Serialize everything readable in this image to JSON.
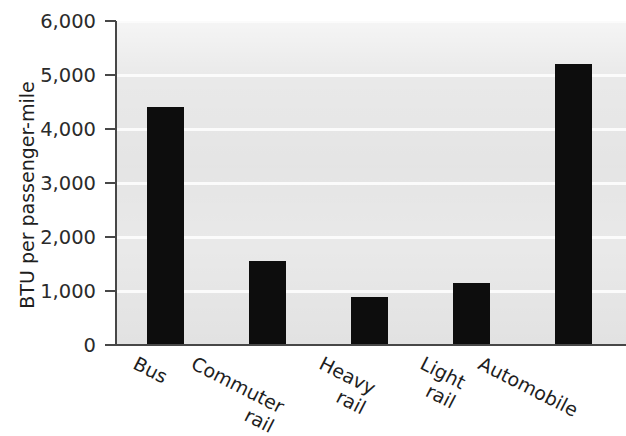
{
  "chart_data": {
    "type": "bar",
    "title": "",
    "subtitle": "",
    "xlabel": "",
    "ylabel": "BTU per passenger-mile",
    "categories": [
      "Bus",
      "Commuter rail",
      "Heavy rail",
      "Light rail",
      "Automobile"
    ],
    "category_lines": [
      [
        "Bus"
      ],
      [
        "Commuter",
        "rail"
      ],
      [
        "Heavy",
        "rail"
      ],
      [
        "Light",
        "rail"
      ],
      [
        "Automobile"
      ]
    ],
    "values": [
      4400,
      1560,
      890,
      1150,
      5200
    ],
    "ylim": [
      0,
      6000
    ],
    "ytick_values": [
      0,
      1000,
      2000,
      3000,
      4000,
      5000,
      6000
    ],
    "ytick_labels": [
      "0",
      "1,000",
      "2,000",
      "3,000",
      "4,000",
      "5,000",
      "6,000"
    ],
    "grid": true,
    "grid_axis": "y",
    "legend": false,
    "legend_position": "none",
    "bar_color": "#0d0d0d",
    "plot_background_color": "#e9e9e9",
    "gridline_color": "#fbfbfb",
    "axis_color": "#474747"
  }
}
